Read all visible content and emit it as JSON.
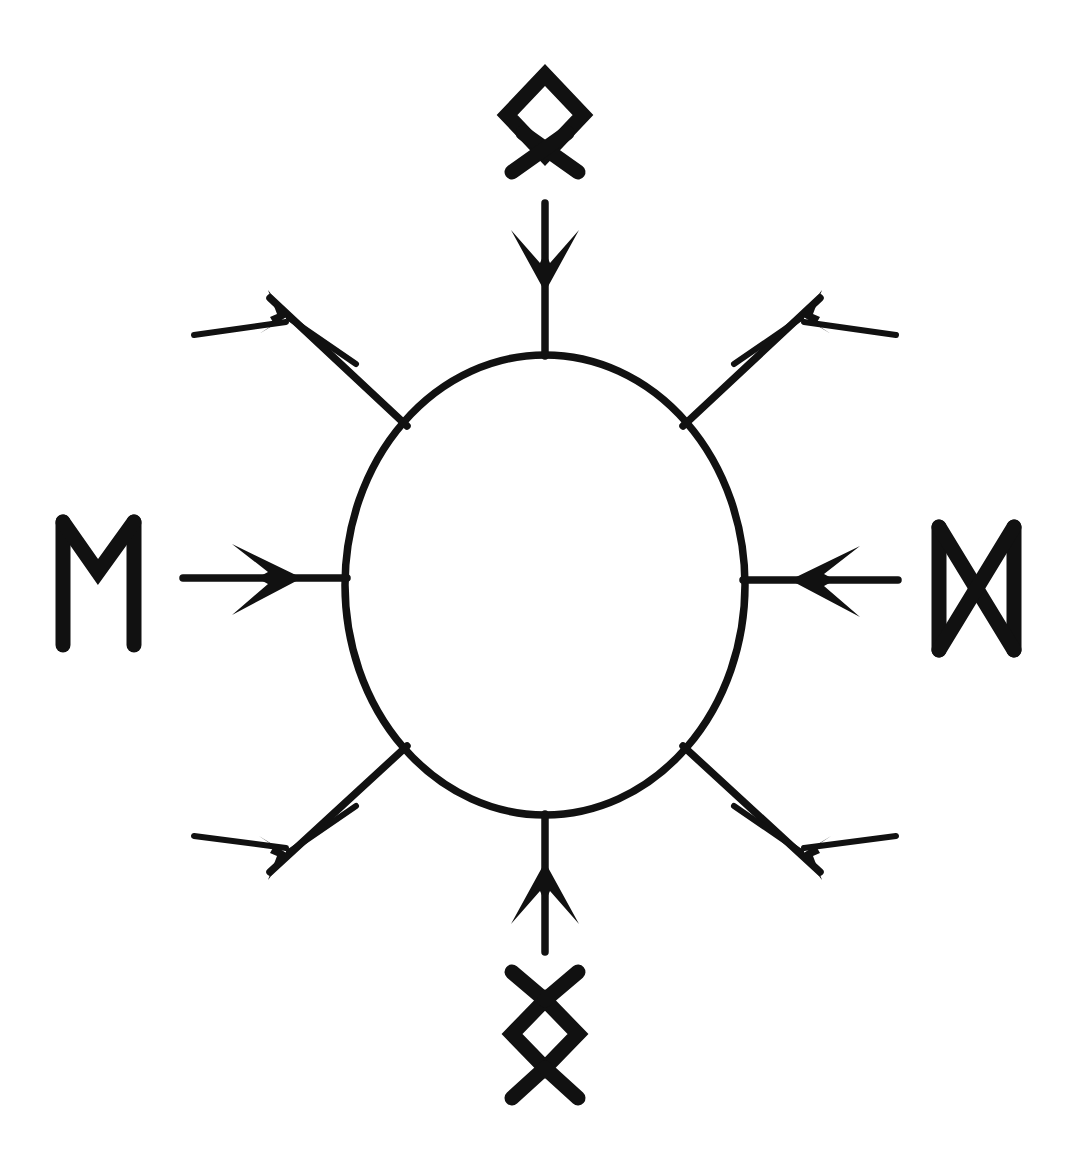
{
  "figure": {
    "background_color": "#ffffff",
    "ink_color": "#111111",
    "canvas": {
      "width": 1080,
      "height": 1160
    }
  },
  "center_shape": {
    "name": "ellipse",
    "cx": 545,
    "cy": 585,
    "rx": 200,
    "ry": 230,
    "stroke_width": 7.5
  },
  "runes": [
    {
      "id": "rune-top",
      "name": "Othala",
      "glyph": "ᛟ",
      "position": "top",
      "meaning_label": "Othala",
      "x": 545,
      "y": 120
    },
    {
      "id": "rune-left",
      "name": "Ehwaz",
      "glyph": "ᛖ",
      "position": "left",
      "meaning_label": "Ehwaz",
      "x": 98,
      "y": 583
    },
    {
      "id": "rune-right",
      "name": "Dagaz",
      "glyph": "ᛞ",
      "position": "right",
      "meaning_label": "Dagaz",
      "x": 976,
      "y": 588
    },
    {
      "id": "rune-bottom",
      "name": "Ingwaz",
      "glyph": "ᛜ",
      "position": "bottom",
      "meaning_label": "Ingwaz",
      "x": 545,
      "y": 1034
    }
  ],
  "arrows": [
    {
      "id": "arrow-top",
      "direction": "inward",
      "points": "down",
      "angle_deg": 90,
      "label": "top inward arrow"
    },
    {
      "id": "arrow-bottom",
      "direction": "inward",
      "points": "up",
      "angle_deg": 270,
      "label": "bottom inward arrow"
    },
    {
      "id": "arrow-left",
      "direction": "inward",
      "points": "right",
      "angle_deg": 0,
      "label": "left inward arrow"
    },
    {
      "id": "arrow-right",
      "direction": "inward",
      "points": "left",
      "angle_deg": 180,
      "label": "right inward arrow"
    },
    {
      "id": "arrow-upper-left",
      "direction": "outward",
      "points": "upper-left",
      "angle_deg": 225,
      "label": "upper-left outward arrow"
    },
    {
      "id": "arrow-upper-right",
      "direction": "outward",
      "points": "upper-right",
      "angle_deg": 315,
      "label": "upper-right outward arrow"
    },
    {
      "id": "arrow-lower-left",
      "direction": "outward",
      "points": "lower-left",
      "angle_deg": 135,
      "label": "lower-left outward arrow"
    },
    {
      "id": "arrow-lower-right",
      "direction": "outward",
      "points": "lower-right",
      "angle_deg": 45,
      "label": "lower-right outward arrow"
    }
  ],
  "summary": {
    "rune_count": 4,
    "arrow_count": 8,
    "inward_arrow_count": 4,
    "outward_arrow_count": 4
  }
}
